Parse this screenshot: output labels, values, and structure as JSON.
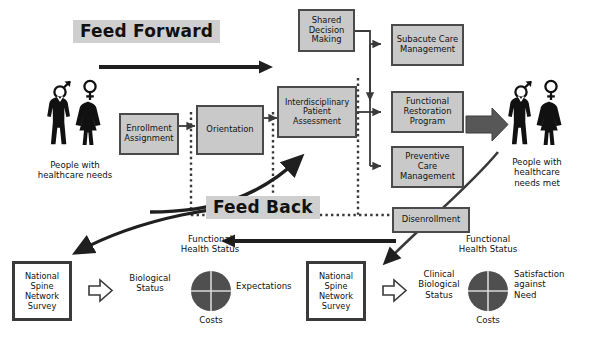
{
  "diagram": {
    "colors": {
      "box_fill": "#c9c9c9",
      "box_border": "#4a4a4a",
      "banner_fill": "#cfcfcf",
      "arrow_dark": "#1f1f1f",
      "block_arrow": "#575757",
      "disk_fill": "#4f4f4f",
      "survey_border": "#3a3a3a",
      "background": "#ffffff"
    },
    "banners": {
      "feed_forward": "Feed Forward",
      "feed_back": "Feed Back"
    },
    "process_boxes": [
      {
        "id": "enrollment-assignment",
        "label": "Enrollment\nAssignment"
      },
      {
        "id": "orientation",
        "label": "Orientation"
      },
      {
        "id": "interdisciplinary-patient-assessment",
        "label": "Interdisciplinary\nPatient\nAssessment"
      },
      {
        "id": "shared-decision-making",
        "label": "Shared\nDecision\nMaking"
      },
      {
        "id": "subacute-care-management",
        "label": "Subacute\nCare\nManagement"
      },
      {
        "id": "functional-restoration-program",
        "label": "Functional\nRestoration\nProgram"
      },
      {
        "id": "preventive-care-management",
        "label": "Preventive\nCare\nManagement"
      },
      {
        "id": "disenrollment",
        "label": "Disenrollment"
      }
    ],
    "actors": {
      "left": {
        "caption": "People with\nhealthcare needs"
      },
      "right": {
        "caption": "People with\nhealthcare\nneeds met"
      }
    },
    "outcomes": [
      {
        "id": "outcome-left",
        "survey_label": "National\nSpine\nNetwork\nSurvey",
        "heading": "Functional\nHealth Status",
        "left_label": "Biological\nStatus",
        "right_label": "Expectations",
        "bottom_label": "Costs"
      },
      {
        "id": "outcome-right",
        "survey_label": "National\nSpine\nNetwork\nSurvey",
        "heading": "Functional\nHealth Status",
        "left_label": "Clinical\nBiological\nStatus",
        "right_label": "Satisfaction\nagainst\nNeed",
        "bottom_label": "Costs"
      }
    ],
    "icons": [
      {
        "name": "male-figure-icon"
      },
      {
        "name": "female-figure-icon"
      },
      {
        "name": "mars-symbol-icon"
      },
      {
        "name": "venus-symbol-icon"
      },
      {
        "name": "block-arrow-right-icon"
      },
      {
        "name": "hollow-block-arrow-right-icon"
      },
      {
        "name": "feedback-curve-arrow-icon"
      },
      {
        "name": "dotted-boundary-icon"
      },
      {
        "name": "quadrant-disk-icon"
      }
    ]
  }
}
